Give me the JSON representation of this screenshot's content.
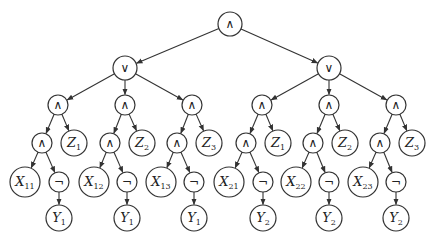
{
  "diagram": {
    "stroke_color": "#333333",
    "nodes": [
      {
        "id": "root",
        "op": "∧",
        "x": 230,
        "y": 24,
        "r": 12
      },
      {
        "id": "or1",
        "op": "∨",
        "x": 125,
        "y": 68,
        "r": 12
      },
      {
        "id": "or2",
        "op": "∨",
        "x": 329,
        "y": 68,
        "r": 12
      },
      {
        "id": "a11",
        "op": "∧",
        "x": 58,
        "y": 105,
        "r": 10
      },
      {
        "id": "a12",
        "op": "∧",
        "x": 125,
        "y": 105,
        "r": 10
      },
      {
        "id": "a13",
        "op": "∧",
        "x": 192,
        "y": 105,
        "r": 10
      },
      {
        "id": "a21",
        "op": "∧",
        "x": 262,
        "y": 105,
        "r": 10
      },
      {
        "id": "a22",
        "op": "∧",
        "x": 329,
        "y": 105,
        "r": 10
      },
      {
        "id": "a23",
        "op": "∧",
        "x": 396,
        "y": 105,
        "r": 10
      },
      {
        "id": "b11",
        "op": "∧",
        "x": 42,
        "y": 143,
        "r": 10
      },
      {
        "id": "z11",
        "var": "Z",
        "sub": "1",
        "x": 74,
        "y": 143,
        "r": 13
      },
      {
        "id": "b12",
        "op": "∧",
        "x": 110,
        "y": 143,
        "r": 10
      },
      {
        "id": "z12",
        "var": "Z",
        "sub": "2",
        "x": 142,
        "y": 143,
        "r": 13
      },
      {
        "id": "b13",
        "op": "∧",
        "x": 177,
        "y": 143,
        "r": 10
      },
      {
        "id": "z13",
        "var": "Z",
        "sub": "3",
        "x": 209,
        "y": 143,
        "r": 13
      },
      {
        "id": "b21",
        "op": "∧",
        "x": 246,
        "y": 143,
        "r": 10
      },
      {
        "id": "z21",
        "var": "Z",
        "sub": "1",
        "x": 278,
        "y": 143,
        "r": 13
      },
      {
        "id": "b22",
        "op": "∧",
        "x": 313,
        "y": 143,
        "r": 10
      },
      {
        "id": "z22",
        "var": "Z",
        "sub": "2",
        "x": 345,
        "y": 143,
        "r": 13
      },
      {
        "id": "b23",
        "op": "∧",
        "x": 380,
        "y": 143,
        "r": 10
      },
      {
        "id": "z23",
        "var": "Z",
        "sub": "3",
        "x": 412,
        "y": 143,
        "r": 13
      },
      {
        "id": "x11",
        "var": "X",
        "sub": "11",
        "x": 25,
        "y": 182,
        "r": 15
      },
      {
        "id": "n11",
        "op": "¬",
        "x": 59,
        "y": 182,
        "r": 10
      },
      {
        "id": "x12",
        "var": "X",
        "sub": "12",
        "x": 94,
        "y": 182,
        "r": 15
      },
      {
        "id": "n12",
        "op": "¬",
        "x": 127,
        "y": 182,
        "r": 10
      },
      {
        "id": "x13",
        "var": "X",
        "sub": "13",
        "x": 161,
        "y": 182,
        "r": 15
      },
      {
        "id": "n13",
        "op": "¬",
        "x": 194,
        "y": 182,
        "r": 10
      },
      {
        "id": "x21",
        "var": "X",
        "sub": "21",
        "x": 229,
        "y": 182,
        "r": 15
      },
      {
        "id": "n21",
        "op": "¬",
        "x": 263,
        "y": 182,
        "r": 10
      },
      {
        "id": "x22",
        "var": "X",
        "sub": "22",
        "x": 296,
        "y": 182,
        "r": 15
      },
      {
        "id": "n22",
        "op": "¬",
        "x": 329,
        "y": 182,
        "r": 10
      },
      {
        "id": "x23",
        "var": "X",
        "sub": "23",
        "x": 363,
        "y": 182,
        "r": 15
      },
      {
        "id": "n23",
        "op": "¬",
        "x": 396,
        "y": 182,
        "r": 10
      },
      {
        "id": "y11",
        "var": "Y",
        "sub": "1",
        "x": 59,
        "y": 218,
        "r": 13
      },
      {
        "id": "y12",
        "var": "Y",
        "sub": "1",
        "x": 127,
        "y": 218,
        "r": 13
      },
      {
        "id": "y13",
        "var": "Y",
        "sub": "1",
        "x": 194,
        "y": 218,
        "r": 13
      },
      {
        "id": "y21",
        "var": "Y",
        "sub": "2",
        "x": 263,
        "y": 218,
        "r": 13
      },
      {
        "id": "y22",
        "var": "Y",
        "sub": "2",
        "x": 329,
        "y": 218,
        "r": 13
      },
      {
        "id": "y23",
        "var": "Y",
        "sub": "2",
        "x": 396,
        "y": 218,
        "r": 13
      }
    ],
    "edges": [
      [
        "root",
        "or1"
      ],
      [
        "root",
        "or2"
      ],
      [
        "or1",
        "a11"
      ],
      [
        "or1",
        "a12"
      ],
      [
        "or1",
        "a13"
      ],
      [
        "or2",
        "a21"
      ],
      [
        "or2",
        "a22"
      ],
      [
        "or2",
        "a23"
      ],
      [
        "a11",
        "b11"
      ],
      [
        "a11",
        "z11"
      ],
      [
        "a12",
        "b12"
      ],
      [
        "a12",
        "z12"
      ],
      [
        "a13",
        "b13"
      ],
      [
        "a13",
        "z13"
      ],
      [
        "a21",
        "b21"
      ],
      [
        "a21",
        "z21"
      ],
      [
        "a22",
        "b22"
      ],
      [
        "a22",
        "z22"
      ],
      [
        "a23",
        "b23"
      ],
      [
        "a23",
        "z23"
      ],
      [
        "b11",
        "x11"
      ],
      [
        "b11",
        "n11"
      ],
      [
        "b12",
        "x12"
      ],
      [
        "b12",
        "n12"
      ],
      [
        "b13",
        "x13"
      ],
      [
        "b13",
        "n13"
      ],
      [
        "b21",
        "x21"
      ],
      [
        "b21",
        "n21"
      ],
      [
        "b22",
        "x22"
      ],
      [
        "b22",
        "n22"
      ],
      [
        "b23",
        "x23"
      ],
      [
        "b23",
        "n23"
      ],
      [
        "n11",
        "y11"
      ],
      [
        "n12",
        "y12"
      ],
      [
        "n13",
        "y13"
      ],
      [
        "n21",
        "y21"
      ],
      [
        "n22",
        "y22"
      ],
      [
        "n23",
        "y23"
      ]
    ]
  }
}
